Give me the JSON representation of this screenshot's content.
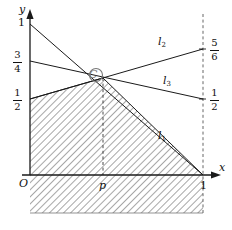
{
  "figure": {
    "kind": "line-graph-with-shaded-region",
    "axes": {
      "x_axis_label": "x",
      "y_axis_label": "y",
      "origin_label": "O"
    },
    "x_ticks": [
      {
        "label": "p",
        "value": 0.42,
        "italic": true
      },
      {
        "label": "1",
        "value": 1,
        "italic": false
      }
    ],
    "y_left_ticks": [
      {
        "label": "1",
        "is_fraction": false,
        "numerator": "",
        "denominator": "",
        "value": 1
      },
      {
        "label": "3/4",
        "is_fraction": true,
        "numerator": "3",
        "denominator": "4",
        "value": 0.75
      },
      {
        "label": "1/2",
        "is_fraction": true,
        "numerator": "1",
        "denominator": "2",
        "value": 0.5
      }
    ],
    "y_right_ticks": [
      {
        "label": "5/6",
        "is_fraction": true,
        "numerator": "5",
        "denominator": "6",
        "value": 0.8333
      },
      {
        "label": "1/2",
        "is_fraction": true,
        "numerator": "1",
        "denominator": "2",
        "value": 0.5
      }
    ],
    "lines": [
      {
        "name": "l1",
        "base": "l",
        "sub": "1",
        "from": [
          0,
          1
        ],
        "to": [
          1,
          0
        ],
        "label_at": [
          0.72,
          0.3
        ]
      },
      {
        "name": "l2",
        "base": "l",
        "sub": "2",
        "from": [
          0,
          0.5
        ],
        "to": [
          1,
          0.8333
        ],
        "label_at": [
          0.72,
          0.8
        ]
      },
      {
        "name": "l3",
        "base": "l",
        "sub": "3",
        "from": [
          0,
          0.75
        ],
        "to": [
          1,
          0.5
        ],
        "label_at": [
          0.76,
          0.6
        ]
      }
    ],
    "marked_point": {
      "label": "C",
      "x": 0.42,
      "y": 0.64,
      "marker": "circle-outline"
    },
    "guides": [
      {
        "kind": "vertical-dashed",
        "x": 0.42,
        "from_y": 0,
        "to_y": 0.64
      },
      {
        "kind": "vertical-dashed",
        "x": 1,
        "from_y": -0.36,
        "to_y": 1.06
      }
    ],
    "shaded_region": {
      "style": "diagonal-hatch",
      "description": "lower envelope of l2 and l1",
      "hatch_angle_deg": 45,
      "upper_boundary_vertices": [
        [
          0,
          0.5
        ],
        [
          0.42,
          0.64
        ],
        [
          1,
          0
        ]
      ],
      "extends_below_axis": true,
      "bottom_y": -0.36
    },
    "colors": {
      "stroke": "#1a1a1a",
      "hatch": "#555555",
      "dash": "#555555",
      "background": "#ffffff"
    }
  }
}
